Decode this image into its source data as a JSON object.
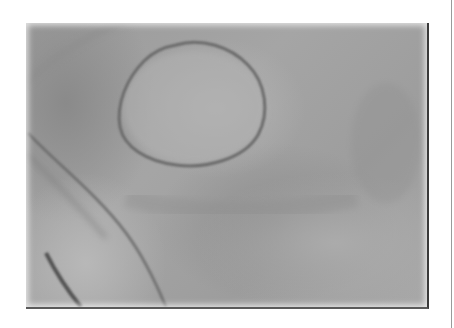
{
  "image": {
    "subject": "grayscale clinical photograph of skin with circular ring-shaped lesion",
    "colors": {
      "background": "#ffffff",
      "skin_mid": "#a0a0a0",
      "lesion_ring": "#6a6a6a",
      "crease": "#555555",
      "frame_border": "#3a3a3a"
    }
  }
}
